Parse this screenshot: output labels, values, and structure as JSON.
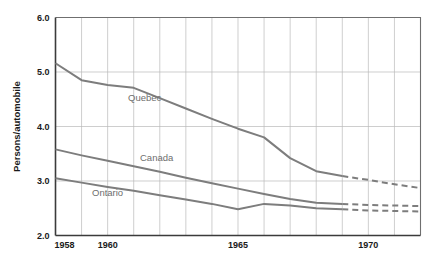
{
  "chart_data": {
    "type": "line",
    "title": "",
    "xlabel": "",
    "ylabel": "Persons/automobile",
    "xlim": [
      1958,
      1972
    ],
    "ylim": [
      2.0,
      6.0
    ],
    "grid": true,
    "legend_position": "inline-labels",
    "y_ticks": [
      "2.0",
      "3.0",
      "4.0",
      "5.0",
      "6.0"
    ],
    "y_tick_values": [
      2.0,
      3.0,
      4.0,
      5.0,
      6.0
    ],
    "x_ticks": [
      "1958",
      "1960",
      "1965",
      "1970"
    ],
    "x_tick_values": [
      1958,
      1960,
      1965,
      1970
    ],
    "x_minor_step": 1,
    "series": [
      {
        "name": "Quebec",
        "label": "Quebec",
        "color": "#7d7d7d",
        "x": [
          1958,
          1959,
          1960,
          1961,
          1962,
          1963,
          1964,
          1965,
          1966,
          1967,
          1968,
          1969
        ],
        "values": [
          5.16,
          4.85,
          4.76,
          4.71,
          4.52,
          4.33,
          4.14,
          3.96,
          3.8,
          3.42,
          3.18,
          3.09
        ],
        "projection_x": [
          1969,
          1970,
          1971,
          1972
        ],
        "projection_values": [
          3.09,
          3.02,
          2.94,
          2.87
        ]
      },
      {
        "name": "Canada",
        "label": "Canada",
        "color": "#7d7d7d",
        "x": [
          1958,
          1959,
          1960,
          1961,
          1962,
          1963,
          1964,
          1965,
          1966,
          1967,
          1968,
          1969
        ],
        "values": [
          3.58,
          3.47,
          3.37,
          3.27,
          3.17,
          3.06,
          2.96,
          2.86,
          2.76,
          2.67,
          2.6,
          2.58
        ],
        "projection_x": [
          1969,
          1970,
          1971,
          1972
        ],
        "projection_values": [
          2.58,
          2.56,
          2.55,
          2.54
        ]
      },
      {
        "name": "Ontario",
        "label": "Ontario",
        "color": "#7d7d7d",
        "x": [
          1958,
          1959,
          1960,
          1961,
          1962,
          1963,
          1964,
          1965,
          1966,
          1967,
          1968,
          1969
        ],
        "values": [
          3.05,
          2.97,
          2.89,
          2.82,
          2.74,
          2.66,
          2.58,
          2.48,
          2.58,
          2.55,
          2.5,
          2.48
        ],
        "projection_x": [
          1969,
          1970,
          1971,
          1972
        ],
        "projection_values": [
          2.48,
          2.46,
          2.45,
          2.44
        ]
      }
    ]
  },
  "axis": {
    "y_title": "Persons/automobile"
  }
}
